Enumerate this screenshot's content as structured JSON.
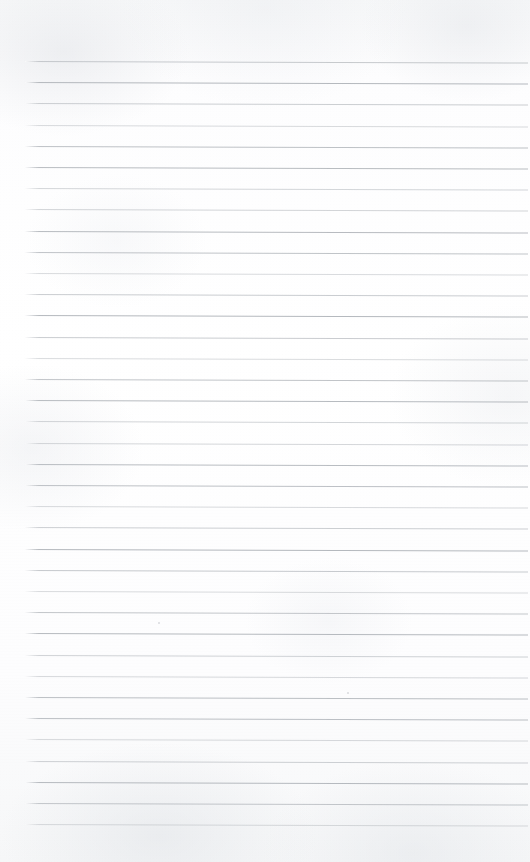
{
  "document": {
    "type": "scanned-document",
    "subject": "blank ruled notebook page",
    "title": "",
    "visible_text": "",
    "handwriting": "none",
    "printed_text": "none"
  },
  "page": {
    "width": 530,
    "height": 862,
    "background_color": "#fcfcfd",
    "paper_tone": "off-white",
    "texture": "subtle mottled scan grain",
    "border": "none",
    "margins": {
      "top": 61,
      "bottom": 38,
      "left": 25,
      "right": 2
    }
  },
  "ruling": {
    "style": "horizontal single rules",
    "line_color": "#b5b9be",
    "line_thickness_px": 1,
    "line_count": 37,
    "spacing_px": 21.2,
    "first_line_y": 61,
    "last_line_y": 824,
    "line_start_x": 25,
    "line_end_x": 528,
    "tilt_degrees": 0.18,
    "margin_rule": "none",
    "opacity_range": [
      0.5,
      1.0
    ]
  },
  "artifacts": {
    "specks": [
      {
        "x": 158,
        "y": 622,
        "size": 2
      },
      {
        "x": 347,
        "y": 692,
        "size": 2
      }
    ],
    "edge_shading": "slight darkening along top and bottom edges"
  }
}
